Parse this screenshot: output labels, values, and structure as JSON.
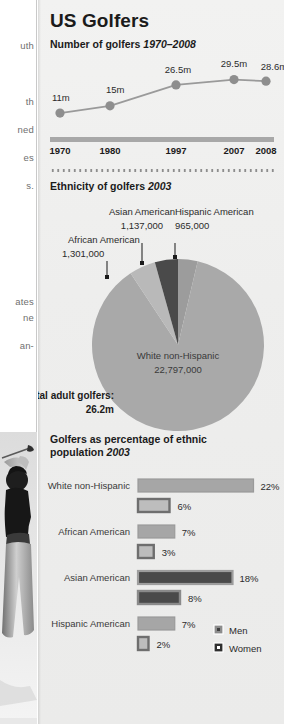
{
  "page_title": "US Golfers",
  "margin_text_fragments": [
    {
      "text": "uth",
      "top": 40
    },
    {
      "text": "th",
      "top": 96
    },
    {
      "text": "ned",
      "top": 124
    },
    {
      "text": "es",
      "top": 152
    },
    {
      "text": "s.",
      "top": 180
    },
    {
      "text": "ates",
      "top": 296
    },
    {
      "text": "ne",
      "top": 312
    },
    {
      "text": "an-",
      "top": 340
    }
  ],
  "photo": {
    "name": "golfer-swing-photo",
    "alt": "Black and white photo of a golfer mid-swing"
  },
  "sections": {
    "line": {
      "title_bold": "Number of golfers",
      "title_italic": "1970–2008"
    },
    "pie": {
      "title_bold": "Ethnicity of golfers",
      "title_italic": "2003"
    },
    "bars": {
      "title_bold": "Golfers as percentage of ethnic population",
      "title_italic": "2003"
    }
  },
  "chart_data": [
    {
      "type": "line",
      "title": "Number of golfers 1970–2008",
      "xlabel": "",
      "ylabel": "Millions of golfers",
      "categories": [
        "1970",
        "1980",
        "1997",
        "2007",
        "2008"
      ],
      "values": [
        11,
        15,
        26.5,
        29.5,
        28.6
      ],
      "value_labels": [
        "11m",
        "15m",
        "26.5m",
        "29.5m",
        "28.6m"
      ],
      "ylim": [
        0,
        32
      ],
      "grid": false,
      "legend": "none",
      "marker_color": "#8e8e8e",
      "line_color": "#9a9a9a",
      "axis_bar_color": "#a8a8a8"
    },
    {
      "type": "pie",
      "title": "Ethnicity of golfers 2003",
      "total_label": "Total adult golfers:",
      "total_value": "26.2m",
      "slices": [
        {
          "label": "White non-Hispanic",
          "value": 22797000,
          "value_label": "22,797,000",
          "color": "#a9a9a9",
          "position": "inside"
        },
        {
          "label": "African American",
          "value": 1301000,
          "value_label": "1,301,000",
          "color": "#b9b9b9",
          "position": "outside-left"
        },
        {
          "label": "Asian American",
          "value": 1137000,
          "value_label": "1,137,000",
          "color": "#4a4a4a",
          "position": "outside-top"
        },
        {
          "label": "Hispanic American",
          "value": 965000,
          "value_label": "965,000",
          "color": "#9c9c9c",
          "position": "outside-right"
        }
      ]
    },
    {
      "type": "bar",
      "title": "Golfers as percentage of ethnic population 2003",
      "orientation": "horizontal",
      "categories": [
        "White non-Hispanic",
        "African American",
        "Asian American",
        "Hispanic American"
      ],
      "series": [
        {
          "name": "Men",
          "values": [
            22,
            7,
            18,
            7
          ],
          "value_labels": [
            "22%",
            "7%",
            "18%",
            "7%"
          ]
        },
        {
          "name": "Women",
          "values": [
            6,
            3,
            8,
            2
          ],
          "value_labels": [
            "6%",
            "3%",
            "8%",
            "2%"
          ]
        }
      ],
      "xlim": [
        0,
        24
      ],
      "grid": false,
      "legend": [
        "Men",
        "Women"
      ],
      "legend_position": "bottom-right",
      "bar_colors": {
        "default_men": "#a6a6a6",
        "default_women_fill": "#bdbdbd",
        "default_women_stroke": "#6e6e6e",
        "highlight_men": "#4a4a4a",
        "highlight_women_fill": "#4a4a4a",
        "highlight_women_stroke": "#8a8a8a",
        "highlight_category": "Asian American"
      }
    }
  ]
}
